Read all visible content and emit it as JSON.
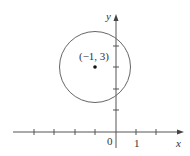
{
  "figure": {
    "type": "circle-on-coordinate-plane",
    "axes": {
      "x_label": "x",
      "y_label": "y",
      "origin_label": "0",
      "x_tick_label": "1",
      "x_ticks": [
        -4,
        -3,
        -2,
        -1,
        1,
        2
      ],
      "y_ticks": [
        1,
        2,
        3,
        4
      ]
    },
    "circle": {
      "center": [
        -1,
        3
      ],
      "center_label": "(−1, 3)",
      "radius_units": 1.7
    },
    "colors": {
      "stroke": "#555555",
      "text": "#333333",
      "background": "#ffffff"
    }
  }
}
